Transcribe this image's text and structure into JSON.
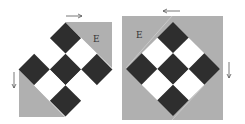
{
  "colors": {
    "gray": "#b0b0b0",
    "dark": "#2e2e2e",
    "light": "#ffffff",
    "arrow": "#555555",
    "seam": "#d8d8d8"
  },
  "figures": [
    {
      "id": "left",
      "label": "E",
      "arrows": [
        {
          "direction": "right"
        },
        {
          "direction": "down"
        }
      ]
    },
    {
      "id": "right",
      "label": "E",
      "arrows": [
        {
          "direction": "left"
        },
        {
          "direction": "down"
        }
      ]
    }
  ]
}
